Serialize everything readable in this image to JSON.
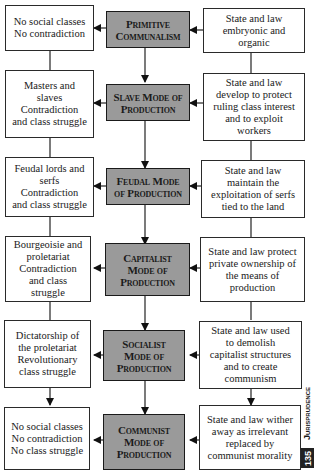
{
  "diagram": {
    "stages": [
      {
        "center": "Primitive\nCommunalism",
        "left": "No social classes\nNo contradiction",
        "right": "State and law\nembryonic and\norganic"
      },
      {
        "center": "Slave Mode of\nProduction",
        "left": "Masters and\nslaves\nContradiction\nand class struggle",
        "right": "State and law\ndevelop to protect\nruling class interest\nand to exploit\nworkers"
      },
      {
        "center": "Feudal Mode\nof Production",
        "left": "Feudal lords and\nserfs\nContradiction\nand class struggle",
        "right": "State and law\nmaintain the\nexploitation of serfs\ntied to the land"
      },
      {
        "center": "Capitalist\nMode of\nProduction",
        "left": "Bourgeoisie and\nproletariat\nContradiction\nand class\nstruggle",
        "right": "State and law protect\nprivate ownership of\nthe means of\nproduction"
      },
      {
        "center": "Socialist\nMode of\nProduction",
        "left": "Dictatorship of\nthe proletariat\nRevolutionary\nclass struggle",
        "right": "State and law used\nto demolish\ncapitalist structures\nand to create\ncommunism"
      },
      {
        "center": "Communist\nMode of\nProduction",
        "left": "No social classes\nNo contradiction\nNo class struggle",
        "right": "State and law wither\naway as irrelevant\nreplaced by\ncommunist morality"
      }
    ]
  },
  "margin": {
    "section_title": "Jurisprudence",
    "page_number": "135"
  },
  "colors": {
    "center_fill": "#9a9a9a",
    "border": "#1a1a1a",
    "background": "#ffffff"
  }
}
